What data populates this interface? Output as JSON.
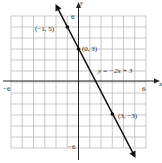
{
  "chart_data": {
    "type": "line",
    "title": "",
    "xlabel": "x",
    "ylabel": "y",
    "xlim": [
      -6,
      6
    ],
    "ylim": [
      -6,
      6
    ],
    "grid": true,
    "tick_labels": {
      "x": [
        "-6",
        "6"
      ],
      "y": [
        "6",
        "-6"
      ]
    },
    "series": [
      {
        "name": "y = -2x + 3",
        "equation": "y = -2x + 3",
        "slope": -2,
        "intercept": 3
      }
    ],
    "points": [
      {
        "x": -1,
        "y": 5,
        "label": "(−1, 5)"
      },
      {
        "x": 0,
        "y": 3,
        "label": "(0, 3)"
      },
      {
        "x": 3,
        "y": -3,
        "label": "(3, −3)"
      }
    ],
    "annotations": [
      {
        "text": "y = −2x + 3",
        "x": 2.5,
        "y": 1.5
      }
    ]
  },
  "labels": {
    "x_axis": "x",
    "y_axis": "y",
    "x_min": "−6",
    "x_max": "6",
    "y_max": "6",
    "y_min": "−6",
    "p1": "(−1, 5)",
    "p2": "(0, 3)",
    "p3": "(3, −3)",
    "equation": "y = −2x + 3"
  }
}
